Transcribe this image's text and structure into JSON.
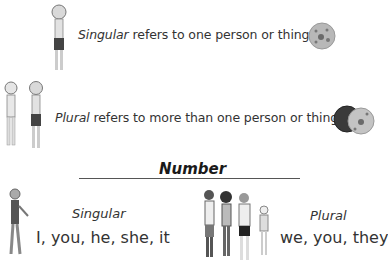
{
  "singular_definition": {
    "term": "Singular",
    "rest": " refers to one person or thing."
  },
  "plural_definition": {
    "term": "Plural",
    "rest": " refers to more than one person or thing."
  },
  "section": {
    "title": "Number"
  },
  "singular_column": {
    "label": "Singular",
    "pronouns": "I, you, he, she, it"
  },
  "plural_column": {
    "label": "Plural",
    "pronouns": "we, you, they"
  },
  "colors": {
    "text": "#333333",
    "rule": "#555555",
    "ball_light": "#b8b8b8",
    "ball_dark": "#3a3a3a"
  }
}
